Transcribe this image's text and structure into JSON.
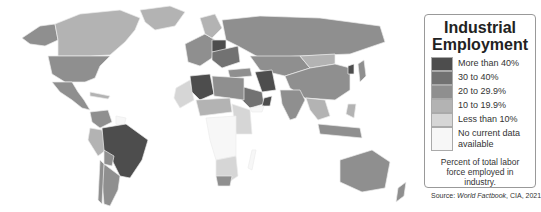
{
  "legend": {
    "title_line1": "Industrial",
    "title_line2": "Employment",
    "items": [
      {
        "label": "More than 40%",
        "color": "#4d4d4d"
      },
      {
        "label": "30 to 40%",
        "color": "#727272"
      },
      {
        "label": "20 to 29.9%",
        "color": "#8f8f8f"
      },
      {
        "label": "10 to 19.9%",
        "color": "#b3b3b3"
      },
      {
        "label": "Less than 10%",
        "color": "#d6d6d6"
      },
      {
        "label": "No current data available",
        "color": "#f7f7f7"
      }
    ],
    "note": "Percent of total labor force employed in industry.",
    "source_prefix": "Source: ",
    "source_title": "World Factbook",
    "source_suffix": ", CIA, 2021"
  },
  "map": {
    "ocean_color": "#ffffff",
    "border_color": "#eeeeee"
  }
}
